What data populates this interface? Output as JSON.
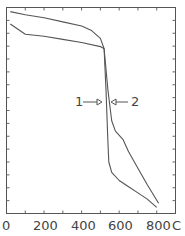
{
  "chart_data": {
    "type": "line",
    "title": "",
    "xlabel": "",
    "x_unit": "C",
    "ylabel": "",
    "xlim": [
      0,
      900
    ],
    "x_tick_labels": [
      "0",
      "200",
      "400",
      "600",
      "800"
    ],
    "x_unit_label": "C",
    "grid": false,
    "legend": "none",
    "annotations": [
      {
        "text": "1",
        "arrow": "right",
        "points_to_series": "1"
      },
      {
        "text": "2",
        "arrow": "left",
        "points_to_series": "2"
      }
    ],
    "series": [
      {
        "name": "1",
        "x": [
          20,
          100,
          200,
          300,
          400,
          500,
          520,
          530,
          540,
          545,
          560,
          600,
          650,
          700,
          750,
          800
        ],
        "y": [
          92,
          87,
          86,
          84.5,
          83,
          81,
          80,
          60,
          35,
          25,
          20,
          16,
          13,
          10,
          7,
          3
        ]
      },
      {
        "name": "2",
        "x": [
          20,
          100,
          200,
          300,
          400,
          450,
          500,
          520,
          540,
          560,
          580,
          620,
          650,
          700,
          750,
          810
        ],
        "y": [
          98,
          96.5,
          95,
          93,
          91,
          89,
          85,
          80,
          60,
          45,
          40,
          36,
          30,
          22,
          14,
          5
        ]
      }
    ]
  },
  "axis": {
    "x_labels": [
      "0",
      "200",
      "400",
      "600",
      "800"
    ],
    "unit": "C"
  },
  "annotations": {
    "label1": "1",
    "label2": "2"
  }
}
